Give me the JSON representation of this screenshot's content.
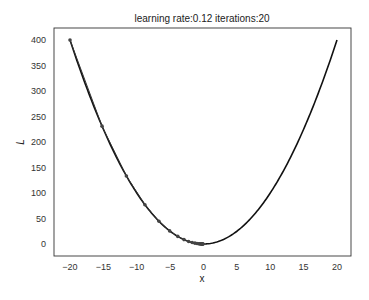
{
  "chart_data": {
    "type": "line",
    "title": "learning rate:0.12 iterations:20",
    "xlabel": "x",
    "ylabel": "L",
    "xlim": [
      -22,
      22
    ],
    "ylim": [
      -20,
      420
    ],
    "xticks": [
      -20,
      -15,
      -10,
      -5,
      0,
      5,
      10,
      15,
      20
    ],
    "yticks": [
      0,
      50,
      100,
      150,
      200,
      250,
      300,
      350,
      400
    ],
    "grid": false,
    "legend": null,
    "series": [
      {
        "name": "L = x^2",
        "kind": "line",
        "color": "#111111",
        "x_range": [
          -20,
          20
        ],
        "function": "x^2"
      },
      {
        "name": "gradient descent path",
        "kind": "line+markers",
        "color": "#333333",
        "x": [
          -20,
          -15.2,
          -11.552,
          -8.78,
          -6.673,
          -5.071,
          -3.854,
          -2.929,
          -2.226,
          -1.692,
          -1.286,
          -0.977,
          -0.743,
          -0.564,
          -0.429,
          -0.326,
          -0.248,
          -0.188,
          -0.143,
          -0.109,
          -0.083
        ],
        "y": [
          400,
          231.04,
          133.45,
          77.09,
          44.53,
          25.72,
          14.86,
          8.58,
          4.96,
          2.86,
          1.65,
          0.95,
          0.55,
          0.32,
          0.18,
          0.11,
          0.06,
          0.04,
          0.02,
          0.01,
          0.007
        ]
      }
    ]
  }
}
